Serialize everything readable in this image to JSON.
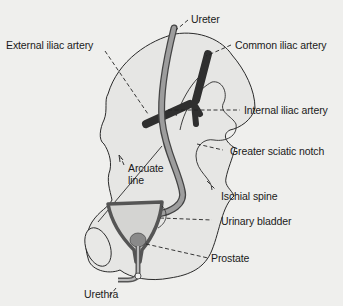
{
  "diagram": {
    "type": "anatomical-illustration",
    "colors": {
      "background": "#efefed",
      "bone_fill": "#e4e4e2",
      "bone_outline": "#2a2a2a",
      "ureter_fill": "#9a9a9a",
      "artery_fill": "#3a3a3a",
      "bladder_fill": "#d6d6d4",
      "prostate_fill": "#888888"
    },
    "labels": [
      {
        "id": "ureter",
        "text": "Ureter"
      },
      {
        "id": "external-iliac-artery",
        "text": "External iliac artery"
      },
      {
        "id": "common-iliac-artery",
        "text": "Common iliac artery"
      },
      {
        "id": "internal-iliac-artery",
        "text": "Internal iliac artery"
      },
      {
        "id": "greater-sciatic-notch",
        "text": "Greater sciatic notch"
      },
      {
        "id": "arcuate-line",
        "text": "Arcuate line",
        "line1": "Arcuate",
        "line2": "line"
      },
      {
        "id": "ischial-spine",
        "text": "Ischial spine"
      },
      {
        "id": "urinary-bladder",
        "text": "Urinary bladder"
      },
      {
        "id": "prostate",
        "text": "Prostate"
      },
      {
        "id": "urethra",
        "text": "Urethra"
      }
    ]
  }
}
